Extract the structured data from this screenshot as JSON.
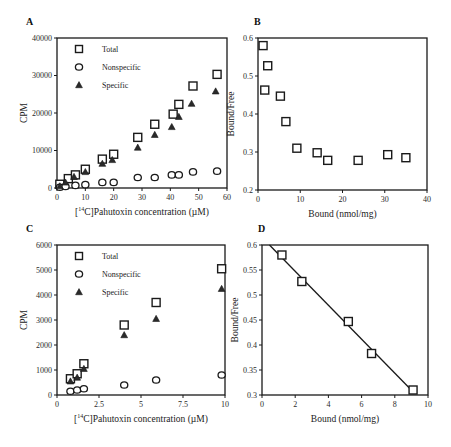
{
  "chart_data": [
    {
      "id": "A",
      "panel_label": "A",
      "type": "scatter",
      "title": "",
      "xlabel_pre": "[",
      "xlabel_sup": "14",
      "xlabel_post": "C]Pahutoxin concentration (µM)",
      "xlabel": "[14C]Pahutoxin concentration (µM)",
      "ylabel": "CPM",
      "xlim": [
        0,
        60
      ],
      "ylim": [
        0,
        40000
      ],
      "xticks": [
        0,
        10,
        20,
        30,
        40,
        50,
        60
      ],
      "yticks": [
        0,
        10000,
        20000,
        30000,
        40000
      ],
      "box": true,
      "grid": false,
      "legend_position": "upper-left",
      "frame": {
        "x0": 57,
        "x1": 227,
        "y0": 188,
        "y1": 38
      },
      "series": [
        {
          "name": "Total",
          "marker": "square",
          "x": [
            1,
            4,
            6.5,
            10,
            16,
            20,
            28.5,
            34.5,
            41,
            43,
            48,
            56.5
          ],
          "y": [
            1000,
            2500,
            3500,
            5000,
            7700,
            9000,
            13500,
            17000,
            19700,
            22300,
            27200,
            30300
          ]
        },
        {
          "name": "Nonspecific",
          "marker": "circle",
          "x": [
            1,
            3,
            6.5,
            10,
            16,
            20,
            28.5,
            34.5,
            40.5,
            43,
            48,
            56.5
          ],
          "y": [
            200,
            400,
            700,
            900,
            1500,
            1500,
            2800,
            2800,
            3500,
            3500,
            4300,
            4500
          ]
        },
        {
          "name": "Specific",
          "marker": "triangle",
          "x": [
            1,
            3,
            6,
            10,
            16,
            19.5,
            28.5,
            34.5,
            40.5,
            43,
            47.5,
            56
          ],
          "y": [
            500,
            1500,
            3000,
            4300,
            6500,
            7500,
            10800,
            14200,
            16300,
            19000,
            22500,
            25800
          ]
        }
      ]
    },
    {
      "id": "B",
      "panel_label": "B",
      "type": "scatter",
      "title": "",
      "xlabel": "Bound (nmol/mg)",
      "ylabel": "Bound/Free",
      "xlim": [
        0,
        40
      ],
      "ylim": [
        0.2,
        0.6
      ],
      "xticks": [
        0,
        10,
        20,
        30,
        40
      ],
      "yticks": [
        0.2,
        0.3,
        0.4,
        0.5,
        0.6
      ],
      "box": true,
      "grid": false,
      "frame": {
        "x0": 258,
        "x1": 427,
        "y0": 190,
        "y1": 38
      },
      "series": [
        {
          "name": "Bound/Free",
          "marker": "square",
          "x": [
            1.2,
            2.3,
            1.6,
            5.3,
            6.6,
            9.2,
            14,
            16.5,
            23.7,
            30.7,
            35
          ],
          "y": [
            0.58,
            0.527,
            0.463,
            0.447,
            0.38,
            0.31,
            0.298,
            0.278,
            0.278,
            0.293,
            0.285
          ]
        }
      ]
    },
    {
      "id": "C",
      "panel_label": "C",
      "type": "scatter",
      "title": "",
      "xlabel_pre": "[",
      "xlabel_sup": "14",
      "xlabel_post": "C]Pahutoxin concentration (µM)",
      "xlabel": "[14C]Pahutoxin concentration (µM)",
      "ylabel": "CPM",
      "xlim": [
        0,
        10
      ],
      "ylim": [
        0,
        6000
      ],
      "xticks": [
        0,
        2.5,
        5,
        7.5,
        10
      ],
      "yticks": [
        0,
        1000,
        2000,
        3000,
        4000,
        5000,
        6000
      ],
      "box": true,
      "grid": false,
      "legend_position": "upper-left",
      "frame": {
        "x0": 57,
        "x1": 225,
        "y0": 395,
        "y1": 245
      },
      "series": [
        {
          "name": "Total",
          "marker": "square",
          "x": [
            0.8,
            1.2,
            1.6,
            4,
            5.9,
            9.8
          ],
          "y": [
            650,
            850,
            1250,
            2800,
            3700,
            5050
          ]
        },
        {
          "name": "Nonspecific",
          "marker": "circle",
          "x": [
            0.8,
            1.2,
            1.6,
            4,
            5.9,
            9.8
          ],
          "y": [
            150,
            200,
            250,
            400,
            600,
            800
          ]
        },
        {
          "name": "Specific",
          "marker": "triangle",
          "x": [
            0.8,
            1.2,
            1.6,
            4,
            5.9,
            9.8
          ],
          "y": [
            550,
            700,
            1050,
            2400,
            3050,
            4250
          ]
        }
      ]
    },
    {
      "id": "D",
      "panel_label": "D",
      "type": "scatter",
      "title": "",
      "xlabel": "Bound (nmol/mg)",
      "ylabel": "Bound/Free",
      "xlim": [
        0,
        10
      ],
      "ylim": [
        0.3,
        0.6
      ],
      "xticks": [
        0,
        2,
        4,
        6,
        8,
        10
      ],
      "yticks": [
        0.3,
        0.35,
        0.4,
        0.45,
        0.5,
        0.55,
        0.6
      ],
      "box": true,
      "grid": false,
      "frame": {
        "x0": 262,
        "x1": 428,
        "y0": 395,
        "y1": 245
      },
      "series": [
        {
          "name": "Bound/Free",
          "marker": "square",
          "x": [
            1.2,
            2.4,
            5.2,
            6.6,
            9.1
          ],
          "y": [
            0.58,
            0.527,
            0.447,
            0.383,
            0.31
          ]
        }
      ],
      "fit_line": {
        "x": [
          0.45,
          9.2
        ],
        "y": [
          0.6,
          0.303
        ]
      }
    }
  ]
}
